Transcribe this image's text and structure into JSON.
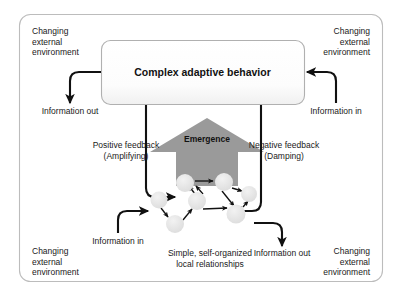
{
  "diagram": {
    "title": "Complex adaptive behavior",
    "emergence_label": "Emergence",
    "network_caption": "Simple, self-organized\nlocal relationships",
    "corner_labels": {
      "top_left": "Changing\nexternal\nenvironment",
      "top_right": "Changing\nexternal\nenvironment",
      "bottom_left": "Changing\nexternal\nenvironment",
      "bottom_right": "Changing\nexternal\nenvironment"
    },
    "flow_labels": {
      "information_out_top": "Information out",
      "information_in_top": "Information in",
      "information_in_bottom": "Information in",
      "information_out_bottom": "Information out",
      "positive_feedback": "Positive feedback\n(Amplifying)",
      "negative_feedback": "Negative feedback\n(Damping)"
    },
    "colors": {
      "outer_border": "#bcbcbc",
      "box_border": "#b0b0b0",
      "box_fill": "#fbfbfb",
      "emergence_fill": "#9a9a9a",
      "node_fill": "#e6e6e6",
      "arrow_stroke": "#111111",
      "text": "#1a1a1a",
      "background": "#ffffff"
    },
    "network_nodes": [
      {
        "id": "n1",
        "cx": 185,
        "cy": 183,
        "r": 9
      },
      {
        "id": "n2",
        "cx": 224,
        "cy": 182,
        "r": 9
      },
      {
        "id": "n3",
        "cx": 249,
        "cy": 194,
        "r": 8
      },
      {
        "id": "n4",
        "cx": 159,
        "cy": 200,
        "r": 8.5
      },
      {
        "id": "n5",
        "cx": 197,
        "cy": 201,
        "r": 9
      },
      {
        "id": "n6",
        "cx": 236,
        "cy": 214,
        "r": 9.5
      },
      {
        "id": "n7",
        "cx": 175,
        "cy": 224,
        "r": 9
      }
    ],
    "network_edges": [
      {
        "from": "n1",
        "to": "n2"
      },
      {
        "from": "n2",
        "to": "n3"
      },
      {
        "from": "n5",
        "to": "n1"
      },
      {
        "from": "n2",
        "to": "n6"
      },
      {
        "from": "n4",
        "to": "n7"
      },
      {
        "from": "n7",
        "to": "n5"
      },
      {
        "from": "n5",
        "to": "n6"
      },
      {
        "from": "n6",
        "to": "n3"
      }
    ]
  }
}
